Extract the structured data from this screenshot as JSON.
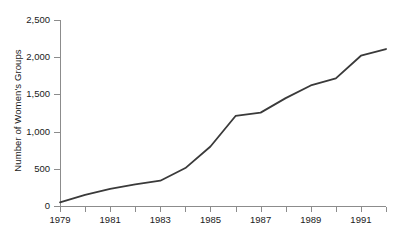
{
  "chart_data": {
    "type": "line",
    "title": "",
    "xlabel": "",
    "ylabel": "Number of Women's Groups",
    "x": [
      1979,
      1980,
      1981,
      1982,
      1983,
      1984,
      1985,
      1986,
      1987,
      1988,
      1989,
      1990,
      1991,
      1992
    ],
    "values": [
      50,
      150,
      230,
      290,
      340,
      510,
      800,
      1210,
      1255,
      1450,
      1620,
      1715,
      2020,
      2110
    ],
    "series": [
      {
        "name": "Number of Women's Groups",
        "values": [
          50,
          150,
          230,
          290,
          340,
          510,
          800,
          1210,
          1255,
          1450,
          1620,
          1715,
          2020,
          2110
        ]
      }
    ],
    "xlim": [
      1979,
      1992
    ],
    "ylim": [
      0,
      2500
    ],
    "y_ticks": [
      0,
      500,
      1000,
      1500,
      2000,
      2500
    ],
    "y_tick_labels": [
      "0",
      "500",
      "1,000",
      "1,500",
      "2,000",
      "2,500"
    ],
    "x_ticks": [
      1979,
      1980,
      1981,
      1982,
      1983,
      1984,
      1985,
      1986,
      1987,
      1988,
      1989,
      1990,
      1991,
      1992
    ],
    "x_tick_labels": [
      "1979",
      "",
      "1981",
      "",
      "1983",
      "",
      "1985",
      "",
      "1987",
      "",
      "1989",
      "",
      "1991",
      ""
    ],
    "grid": false,
    "legend": false,
    "legend_position": "none",
    "line_color": "#3a3a3a",
    "axis_color": "#8c8c8c",
    "text_color": "#1a1a1a",
    "background_color": "#ffffff"
  }
}
